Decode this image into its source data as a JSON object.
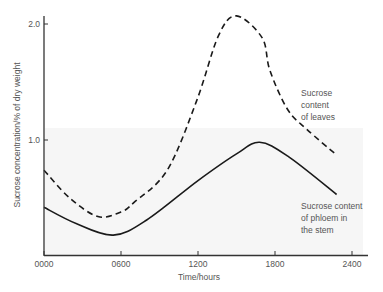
{
  "chart_data": {
    "type": "line",
    "title": "",
    "xlabel": "Time/hours",
    "ylabel": "Sucrose concentration/% of dry weight",
    "x_ticks": [
      "0000",
      "0600",
      "1200",
      "1800",
      "2400"
    ],
    "x_tick_values": [
      0,
      6,
      12,
      18,
      24
    ],
    "y_ticks": [
      "1.0",
      "2.0"
    ],
    "y_tick_values": [
      1.0,
      2.0
    ],
    "xlim": [
      0,
      25
    ],
    "ylim": [
      0,
      2.1
    ],
    "grid": false,
    "legend": "inline annotations",
    "series": [
      {
        "name": "Sucrose content of leaves",
        "style": "dashed",
        "x": [
          0,
          2,
          4.2,
          6,
          7,
          9.6,
          11.9,
          13.6,
          15,
          17,
          17.6,
          19,
          20.5,
          22.7
        ],
        "values": [
          0.74,
          0.5,
          0.34,
          0.38,
          0.46,
          0.74,
          1.34,
          1.9,
          2.07,
          1.88,
          1.6,
          1.26,
          1.09,
          0.88
        ]
      },
      {
        "name": "Sucrose content of phloem in the stem",
        "style": "solid",
        "x": [
          0,
          2.5,
          5.4,
          8,
          12,
          15,
          16.8,
          19,
          22.8
        ],
        "values": [
          0.42,
          0.28,
          0.18,
          0.31,
          0.65,
          0.88,
          0.98,
          0.86,
          0.53
        ]
      }
    ],
    "annotations": [
      {
        "lines": [
          "Sucrose",
          "content",
          "of leaves"
        ],
        "series": "Sucrose content of leaves"
      },
      {
        "lines": [
          "Sucrose content",
          "of phloem in",
          "the stem"
        ],
        "series": "Sucrose content of phloem in the stem"
      }
    ]
  },
  "colors": {
    "line": "#1a1a1a",
    "axis": "#333333",
    "text": "#555555",
    "plot_tint": "#f4f4f4"
  }
}
